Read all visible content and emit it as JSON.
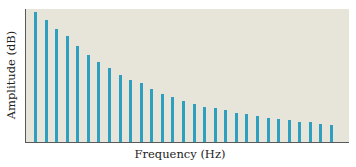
{
  "chart_data": {
    "type": "bar",
    "title": "",
    "xlabel": "Frequency (Hz)",
    "ylabel": "Amplitude (dB)",
    "x_ticks": [],
    "y_ticks": [],
    "grid": false,
    "legend": null,
    "bar_color": "#2e9fbf",
    "background_color": "#e7e4da",
    "categories": [
      1,
      2,
      3,
      4,
      5,
      6,
      7,
      8,
      9,
      10,
      11,
      12,
      13,
      14,
      15,
      16,
      17,
      18,
      19,
      20,
      21,
      22,
      23,
      24,
      25,
      26,
      27,
      28,
      29
    ],
    "values": [
      130,
      122,
      113,
      106,
      96,
      87,
      80,
      74,
      67,
      62,
      59,
      53,
      48,
      45,
      41,
      38,
      35,
      34,
      32,
      29,
      28,
      26,
      24,
      23,
      22,
      20,
      20,
      18,
      17
    ],
    "ylim": [
      0,
      133
    ]
  },
  "labels": {
    "x": "Frequency (Hz)",
    "y": "Amplitude (dB)"
  }
}
